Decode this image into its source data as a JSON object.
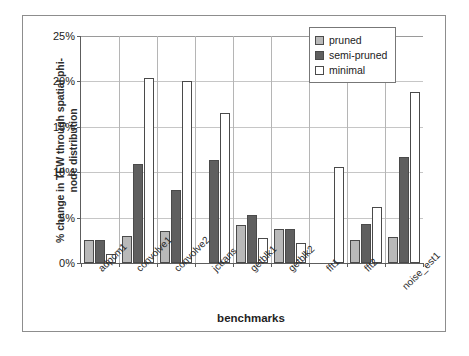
{
  "chart_data": {
    "type": "bar",
    "title": "",
    "subtitle": "",
    "xlabel": "benchmarks",
    "ylabel_line1": "% change in TEW through spatial phi-",
    "ylabel_line2": "node distribution",
    "ylabel": "% change in TEW through spatial phi-node distribution",
    "categories": [
      "adpcm1",
      "convolve1",
      "convolve2",
      "jctrans",
      "getblk1",
      "getblk2",
      "fft1",
      "fft2",
      "noise_est1"
    ],
    "series": [
      {
        "name": "pruned",
        "color": "#b9b9b9",
        "values": [
          2.5,
          3.0,
          3.5,
          null,
          4.2,
          3.7,
          null,
          2.5,
          2.9
        ]
      },
      {
        "name": "semi-pruned",
        "color": "#5f5f5f",
        "values": [
          2.5,
          10.9,
          8.0,
          11.3,
          5.3,
          3.7,
          null,
          4.3,
          11.7
        ]
      },
      {
        "name": "minimal",
        "color": "#ffffff",
        "values": [
          1.0,
          20.4,
          20.0,
          16.5,
          2.7,
          2.2,
          10.6,
          6.2,
          18.8
        ]
      }
    ],
    "ylim": [
      0,
      25
    ],
    "yticks": [
      0,
      5,
      10,
      15,
      20,
      25
    ],
    "ytick_labels": [
      "0%",
      "5%",
      "10%",
      "15%",
      "20%",
      "25%"
    ],
    "grid": true,
    "legend_position": "top-right"
  },
  "legend": {
    "items": [
      {
        "label": "pruned",
        "swatch": "pruned"
      },
      {
        "label": "semi-pruned",
        "swatch": "semi"
      },
      {
        "label": "minimal",
        "swatch": "minimal"
      }
    ]
  }
}
